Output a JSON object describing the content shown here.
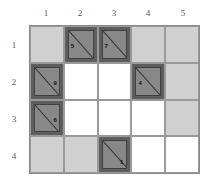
{
  "columns": [
    "1",
    "2",
    "3",
    "4",
    "5"
  ],
  "rows": [
    "1",
    "2",
    "3",
    "4"
  ],
  "colors": {
    "white": "#ffffff",
    "light": "#d0d0d0",
    "dark": "#5e5e5e",
    "inner": "#888888"
  },
  "cells": [
    [
      {
        "type": "light"
      },
      {
        "type": "dark",
        "num": "5",
        "pos": "left"
      },
      {
        "type": "dark",
        "num": "7",
        "pos": "left"
      },
      {
        "type": "light"
      },
      {
        "type": "light"
      }
    ],
    [
      {
        "type": "dark",
        "num": "9",
        "pos": "right"
      },
      {
        "type": "white"
      },
      {
        "type": "white"
      },
      {
        "type": "dark",
        "num": "4",
        "pos": "left"
      },
      {
        "type": "light"
      }
    ],
    [
      {
        "type": "dark",
        "num": "6",
        "pos": "right"
      },
      {
        "type": "white"
      },
      {
        "type": "white"
      },
      {
        "type": "white"
      },
      {
        "type": "light"
      }
    ],
    [
      {
        "type": "light"
      },
      {
        "type": "light"
      },
      {
        "type": "dark",
        "num": "1",
        "pos": "bottom-right"
      },
      {
        "type": "white"
      },
      {
        "type": "white"
      }
    ]
  ]
}
